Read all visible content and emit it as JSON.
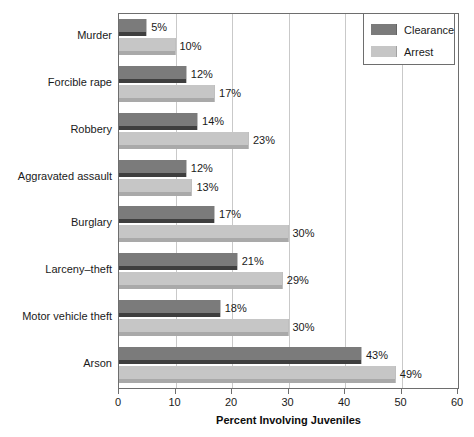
{
  "chart_data": {
    "type": "bar",
    "orientation": "horizontal",
    "title": "",
    "xlabel": "Percent Involving Juveniles",
    "ylabel": "",
    "xlim": [
      0,
      60
    ],
    "xticks": [
      0,
      10,
      20,
      30,
      40,
      50,
      60
    ],
    "grid": "vertical",
    "legend_position": "top-right",
    "value_suffix": "%",
    "categories": [
      "Murder",
      "Forcible rape",
      "Robbery",
      "Aggravated assault",
      "Burglary",
      "Larceny–theft",
      "Motor vehicle theft",
      "Arson"
    ],
    "series": [
      {
        "name": "Clearance",
        "color": "#7b7b7b",
        "values": [
          5,
          12,
          14,
          12,
          17,
          21,
          18,
          43
        ],
        "labels": [
          "5%",
          "12%",
          "14%",
          "12%",
          "17%",
          "21%",
          "18%",
          "43%"
        ]
      },
      {
        "name": "Arrest",
        "color": "#c6c6c6",
        "values": [
          10,
          17,
          23,
          13,
          30,
          29,
          30,
          49
        ],
        "labels": [
          "10%",
          "17%",
          "23%",
          "13%",
          "30%",
          "29%",
          "30%",
          "49%"
        ]
      }
    ]
  },
  "legend": {
    "items": [
      {
        "label": "Clearance",
        "swatch": "clearance"
      },
      {
        "label": "Arrest",
        "swatch": "arrest"
      }
    ]
  }
}
